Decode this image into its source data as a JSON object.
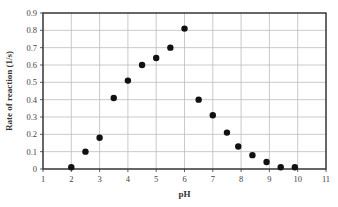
{
  "chart_data": {
    "type": "scatter",
    "title": "",
    "xlabel": "pH",
    "ylabel": "Rate of reaction (1/s)",
    "xlim": [
      1,
      11
    ],
    "ylim": [
      0,
      0.9
    ],
    "xticks": [
      1,
      2,
      3,
      4,
      5,
      6,
      7,
      8,
      9,
      10,
      11
    ],
    "yticks": [
      0,
      0.1,
      0.2,
      0.3,
      0.4,
      0.5,
      0.6,
      0.7,
      0.8,
      0.9
    ],
    "ytick_labels": [
      "0",
      "0.1",
      "0.2",
      "0.3",
      "0.4",
      "0.5",
      "0.6",
      "0.7",
      "0.8",
      "0.9"
    ],
    "grid": true,
    "legend": null,
    "series": [
      {
        "name": "Rate of reaction",
        "color": "#111111",
        "x": [
          2.0,
          2.5,
          3.0,
          3.5,
          4.0,
          4.5,
          5.0,
          5.5,
          6.0,
          6.5,
          7.0,
          7.5,
          7.9,
          8.4,
          8.9,
          9.4,
          9.9
        ],
        "y": [
          0.01,
          0.1,
          0.18,
          0.41,
          0.51,
          0.6,
          0.64,
          0.7,
          0.81,
          0.4,
          0.31,
          0.21,
          0.13,
          0.08,
          0.04,
          0.01,
          0.01
        ]
      }
    ]
  }
}
